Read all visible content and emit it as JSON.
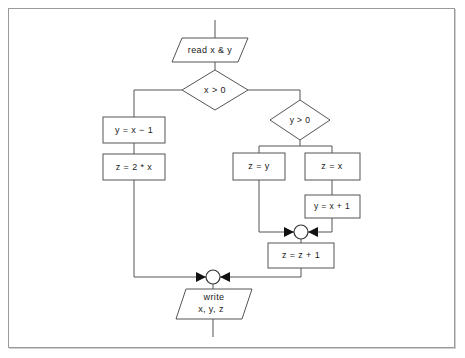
{
  "page": {
    "background_color": "#ffffff",
    "frame_border_color": "#9a9a9a"
  },
  "diagram": {
    "type": "flowchart",
    "line_color": "#555555",
    "text_color": "#1a1a1a",
    "shape_fill": "#ffffff",
    "nodes": [
      {
        "id": "read",
        "shape": "parallelogram",
        "role": "input",
        "label": "read x & y",
        "x": 172,
        "y": 38,
        "width": 76,
        "height": 24
      },
      {
        "id": "x_gt_0",
        "shape": "diamond",
        "role": "decision",
        "label": "x > 0",
        "cx": 215,
        "cy": 90,
        "rx": 33,
        "ry": 20
      },
      {
        "id": "y_eq_x_minus_1",
        "shape": "rectangle",
        "role": "process",
        "label": "y = x − 1",
        "x": 103,
        "y": 117,
        "width": 62,
        "height": 26
      },
      {
        "id": "z_eq_2x",
        "shape": "rectangle",
        "role": "process",
        "label": "z = 2 * x",
        "x": 103,
        "y": 154,
        "width": 62,
        "height": 26
      },
      {
        "id": "y_gt_0",
        "shape": "diamond",
        "role": "decision",
        "label": "y > 0",
        "cx": 300,
        "cy": 120,
        "rx": 30,
        "ry": 20
      },
      {
        "id": "z_eq_y",
        "shape": "rectangle",
        "role": "process",
        "label": "z = y",
        "x": 233,
        "y": 153,
        "width": 52,
        "height": 27
      },
      {
        "id": "z_eq_x",
        "shape": "rectangle",
        "role": "process",
        "label": "z = x",
        "x": 305,
        "y": 153,
        "width": 55,
        "height": 27
      },
      {
        "id": "y_eq_x_plus_1",
        "shape": "rectangle",
        "role": "process",
        "label": "y = x + 1",
        "x": 305,
        "y": 195,
        "width": 55,
        "height": 23
      },
      {
        "id": "merge_inner",
        "shape": "circle",
        "role": "connector",
        "label": "",
        "cx": 301,
        "cy": 232,
        "r": 7
      },
      {
        "id": "z_eq_z_plus_1",
        "shape": "rectangle",
        "role": "process",
        "label": "z = z + 1",
        "x": 268,
        "y": 243,
        "width": 66,
        "height": 25
      },
      {
        "id": "merge_outer",
        "shape": "circle",
        "role": "connector",
        "label": "",
        "cx": 213,
        "cy": 277,
        "r": 7
      },
      {
        "id": "write",
        "shape": "parallelogram",
        "role": "output",
        "label_line1": "write",
        "label_line2": "x, y, z",
        "x": 176,
        "y": 289,
        "width": 76,
        "height": 30
      }
    ],
    "edges": [
      {
        "id": "start-to-read",
        "from": "start",
        "to": "read"
      },
      {
        "id": "read-to-x_gt_0",
        "from": "read",
        "to": "x_gt_0"
      },
      {
        "id": "x_gt_0-left-to-y_eq_x_minus_1",
        "from": "x_gt_0",
        "to": "y_eq_x_minus_1"
      },
      {
        "id": "y_eq_x_minus_1-to-z_eq_2x",
        "from": "y_eq_x_minus_1",
        "to": "z_eq_2x"
      },
      {
        "id": "z_eq_2x-to-merge_outer",
        "from": "z_eq_2x",
        "to": "merge_outer"
      },
      {
        "id": "x_gt_0-right-to-y_gt_0",
        "from": "x_gt_0",
        "to": "y_gt_0"
      },
      {
        "id": "y_gt_0-left-to-z_eq_y",
        "from": "y_gt_0",
        "to": "z_eq_y"
      },
      {
        "id": "y_gt_0-right-to-z_eq_x",
        "from": "y_gt_0",
        "to": "z_eq_x"
      },
      {
        "id": "z_eq_x-to-y_eq_x_plus_1",
        "from": "z_eq_x",
        "to": "y_eq_x_plus_1"
      },
      {
        "id": "z_eq_y-to-merge_inner",
        "from": "z_eq_y",
        "to": "merge_inner"
      },
      {
        "id": "y_eq_x_plus_1-to-merge_inner",
        "from": "y_eq_x_plus_1",
        "to": "merge_inner"
      },
      {
        "id": "merge_inner-to-z_eq_z_plus_1",
        "from": "merge_inner",
        "to": "z_eq_z_plus_1"
      },
      {
        "id": "z_eq_z_plus_1-to-merge_outer",
        "from": "z_eq_z_plus_1",
        "to": "merge_outer"
      },
      {
        "id": "merge_outer-to-write",
        "from": "merge_outer",
        "to": "write"
      },
      {
        "id": "write-to-end",
        "from": "write",
        "to": "end"
      }
    ]
  }
}
